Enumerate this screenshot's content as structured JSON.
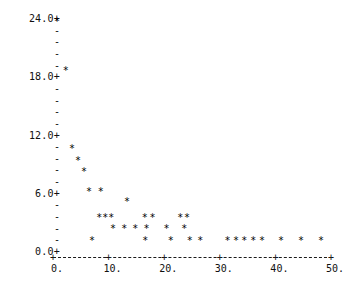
{
  "chart_data": {
    "type": "scatter",
    "title": "",
    "subtitle": "",
    "xlabel": "",
    "ylabel": "",
    "marker": "*",
    "grid": false,
    "legend": null,
    "xlim": [
      0,
      50
    ],
    "ylim": [
      0,
      24
    ],
    "xticks": [
      0,
      10,
      20,
      30,
      40,
      50
    ],
    "xtick_labels": [
      "0.",
      "10.",
      "20.",
      "30.",
      "40.",
      "50."
    ],
    "yticks": [
      0,
      6,
      12,
      18,
      24
    ],
    "ytick_labels": [
      "0.0+",
      "6.0+",
      "12.0+",
      "18.0+",
      "24.0+"
    ],
    "y_minor_tick_glyph": "-",
    "y_minor_count_between_majors": 5,
    "axis_style": "dashed",
    "points": [
      {
        "x": 0.7,
        "y": 24.0
      },
      {
        "x": 2.3,
        "y": 19.0
      },
      {
        "x": 3.4,
        "y": 10.9
      },
      {
        "x": 4.5,
        "y": 9.7
      },
      {
        "x": 5.6,
        "y": 8.5
      },
      {
        "x": 6.5,
        "y": 6.5
      },
      {
        "x": 8.6,
        "y": 6.5
      },
      {
        "x": 7.0,
        "y": 1.4
      },
      {
        "x": 8.3,
        "y": 3.8
      },
      {
        "x": 9.4,
        "y": 3.8
      },
      {
        "x": 10.5,
        "y": 3.8
      },
      {
        "x": 10.8,
        "y": 2.7
      },
      {
        "x": 12.8,
        "y": 2.7
      },
      {
        "x": 13.3,
        "y": 5.5
      },
      {
        "x": 14.8,
        "y": 2.7
      },
      {
        "x": 16.5,
        "y": 3.8
      },
      {
        "x": 17.9,
        "y": 3.8
      },
      {
        "x": 16.8,
        "y": 2.7
      },
      {
        "x": 16.6,
        "y": 1.4
      },
      {
        "x": 20.4,
        "y": 2.7
      },
      {
        "x": 21.2,
        "y": 1.4
      },
      {
        "x": 22.9,
        "y": 3.8
      },
      {
        "x": 24.1,
        "y": 3.8
      },
      {
        "x": 23.6,
        "y": 2.7
      },
      {
        "x": 24.6,
        "y": 1.4
      },
      {
        "x": 26.5,
        "y": 1.4
      },
      {
        "x": 31.4,
        "y": 1.4
      },
      {
        "x": 32.9,
        "y": 1.4
      },
      {
        "x": 34.4,
        "y": 1.4
      },
      {
        "x": 36.0,
        "y": 1.4
      },
      {
        "x": 37.6,
        "y": 1.4
      },
      {
        "x": 41.0,
        "y": 1.4
      },
      {
        "x": 44.6,
        "y": 1.4
      },
      {
        "x": 48.2,
        "y": 1.4
      }
    ]
  },
  "axes": {
    "y_major_labels": [
      {
        "text": "24.0+",
        "value": 24
      },
      {
        "text": "18.0+",
        "value": 18
      },
      {
        "text": "12.0+",
        "value": 12
      },
      {
        "text": "6.0+",
        "value": 6
      },
      {
        "text": "0.0+",
        "value": 0
      }
    ],
    "x_major_labels": [
      {
        "text": "0.",
        "value": 0
      },
      {
        "text": "10.",
        "value": 10
      },
      {
        "text": "20.",
        "value": 20
      },
      {
        "text": "30.",
        "value": 30
      },
      {
        "text": "40.",
        "value": 40
      },
      {
        "text": "50.",
        "value": 50
      }
    ],
    "x_tick_glyph": "+",
    "y_minor_glyph": "-"
  },
  "colors": {
    "background": "#ffffff",
    "foreground": "#101010",
    "marker": "#000000",
    "axis": "#1a1a1a"
  }
}
